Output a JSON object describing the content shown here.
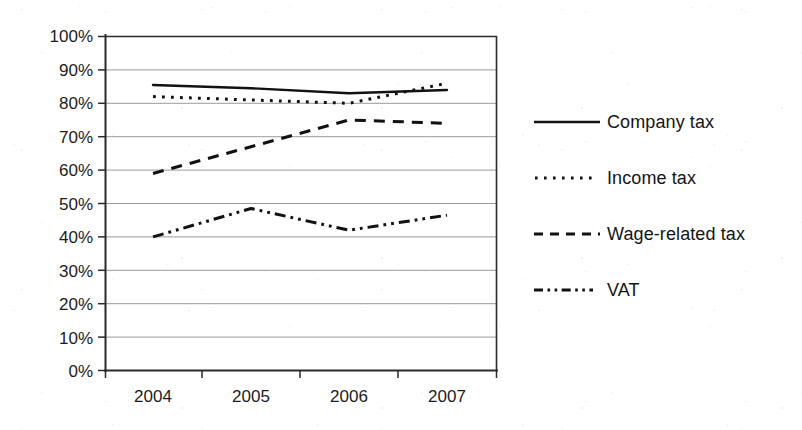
{
  "chart_data": {
    "type": "line",
    "title": "",
    "subtitle": "",
    "xlabel": "",
    "ylabel": "",
    "categories": [
      "2004",
      "2005",
      "2006",
      "2007"
    ],
    "x_tick_labels": [
      "2004",
      "2005",
      "2006",
      "2007"
    ],
    "y_tick_labels": [
      "0%",
      "10%",
      "20%",
      "30%",
      "40%",
      "50%",
      "60%",
      "70%",
      "80%",
      "90%",
      "100%"
    ],
    "y_tick_values": [
      0,
      10,
      20,
      30,
      40,
      50,
      60,
      70,
      80,
      90,
      100
    ],
    "ylim": [
      0,
      100
    ],
    "y_unit": "%",
    "grid": "horizontal",
    "legend_position": "right",
    "series": [
      {
        "name": "Company tax",
        "style": "solid",
        "values": [
          85.5,
          84.5,
          83.0,
          84.0
        ]
      },
      {
        "name": "Income tax",
        "style": "dotted",
        "values": [
          82.0,
          81.0,
          80.0,
          86.0
        ]
      },
      {
        "name": "Wage-related tax",
        "style": "dashed",
        "values": [
          59.0,
          67.0,
          75.0,
          74.0
        ]
      },
      {
        "name": "VAT",
        "style": "dash-dot",
        "values": [
          40.0,
          48.5,
          42.0,
          46.5
        ]
      }
    ]
  },
  "legend": {
    "items": [
      {
        "label": "Company tax",
        "swatch_icon": "solid-line-icon"
      },
      {
        "label": "Income tax",
        "swatch_icon": "dotted-line-icon"
      },
      {
        "label": "Wage-related tax",
        "swatch_icon": "dashed-line-icon"
      },
      {
        "label": "VAT",
        "swatch_icon": "dash-dot-line-icon"
      }
    ]
  },
  "colors": {
    "line": "#111111",
    "grid": "#9a9a9a",
    "axis": "#333333",
    "background": "#ffffff",
    "text": "#141414"
  }
}
